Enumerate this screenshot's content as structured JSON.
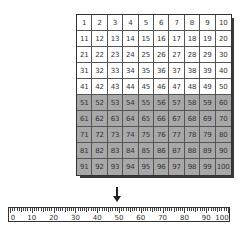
{
  "hundreds_chart": {
    "rows": 10,
    "cols": 10,
    "start": 1,
    "end": 100,
    "shaded_from": 51,
    "shaded_to": 100,
    "colors": {
      "unshaded": "#ffffff",
      "shaded": "#a8a8a8",
      "border": "#555555",
      "shadow": "#3a3a3a"
    },
    "cells": [
      [
        "1",
        "2",
        "3",
        "4",
        "5",
        "6",
        "7",
        "8",
        "9",
        "10"
      ],
      [
        "11",
        "12",
        "13",
        "14",
        "15",
        "16",
        "17",
        "18",
        "19",
        "20"
      ],
      [
        "21",
        "22",
        "23",
        "24",
        "25",
        "26",
        "27",
        "28",
        "29",
        "30"
      ],
      [
        "31",
        "32",
        "33",
        "34",
        "35",
        "36",
        "37",
        "38",
        "39",
        "40"
      ],
      [
        "41",
        "42",
        "43",
        "44",
        "45",
        "46",
        "47",
        "48",
        "49",
        "50"
      ],
      [
        "51",
        "52",
        "53",
        "54",
        "55",
        "56",
        "57",
        "58",
        "59",
        "60"
      ],
      [
        "61",
        "62",
        "63",
        "64",
        "65",
        "66",
        "67",
        "68",
        "69",
        "70"
      ],
      [
        "71",
        "72",
        "73",
        "74",
        "75",
        "76",
        "77",
        "78",
        "79",
        "80"
      ],
      [
        "81",
        "82",
        "83",
        "84",
        "85",
        "86",
        "87",
        "88",
        "89",
        "90"
      ],
      [
        "91",
        "92",
        "93",
        "94",
        "95",
        "96",
        "97",
        "98",
        "99",
        "100"
      ]
    ]
  },
  "arrow": {
    "icon": "down-arrow-icon",
    "points_to": 50
  },
  "number_line": {
    "min": 0,
    "max": 100,
    "minor_step": 1,
    "major_step": 10,
    "labels": [
      "0",
      "10",
      "20",
      "30",
      "40",
      "50",
      "60",
      "70",
      "80",
      "90",
      "100"
    ]
  }
}
